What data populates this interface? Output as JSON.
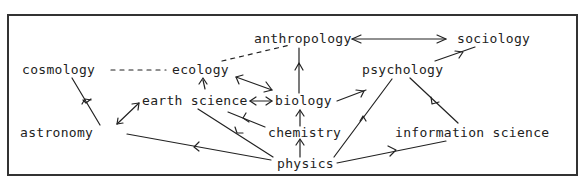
{
  "diagram": {
    "type": "concept-map",
    "stroke_color": "#222222",
    "frame_color": "#333333",
    "nodes": {
      "cosmology": "cosmology",
      "ecology": "ecology",
      "anthropology": "anthropology",
      "sociology": "sociology",
      "psychology": "psychology",
      "earth_science": "earth science",
      "biology": "biology",
      "astronomy": "astronomy",
      "chemistry": "chemistry",
      "information_science": "information science",
      "physics": "physics"
    },
    "edges": [
      {
        "from": "cosmology",
        "to": "ecology",
        "style": "dashed",
        "arrow": "none"
      },
      {
        "from": "ecology",
        "to": "anthropology",
        "style": "dashed",
        "arrow": "none"
      },
      {
        "from": "anthropology",
        "to": "sociology",
        "style": "solid",
        "arrow": "both"
      },
      {
        "from": "psychology",
        "to": "sociology",
        "style": "solid",
        "arrow": "to"
      },
      {
        "from": "biology",
        "to": "anthropology",
        "style": "solid",
        "arrow": "to"
      },
      {
        "from": "ecology",
        "to": "biology",
        "style": "solid",
        "arrow": "both"
      },
      {
        "from": "earth_science",
        "to": "ecology",
        "style": "solid",
        "arrow": "to"
      },
      {
        "from": "earth_science",
        "to": "biology",
        "style": "solid",
        "arrow": "both"
      },
      {
        "from": "biology",
        "to": "psychology",
        "style": "solid",
        "arrow": "to"
      },
      {
        "from": "astronomy",
        "to": "cosmology",
        "style": "solid",
        "arrow": "to"
      },
      {
        "from": "astronomy",
        "to": "earth_science",
        "style": "solid",
        "arrow": "both"
      },
      {
        "from": "chemistry",
        "to": "biology",
        "style": "solid",
        "arrow": "to"
      },
      {
        "from": "chemistry",
        "to": "earth_science",
        "style": "solid",
        "arrow": "to"
      },
      {
        "from": "physics",
        "to": "earth_science",
        "style": "solid",
        "arrow": "to"
      },
      {
        "from": "physics",
        "to": "astronomy",
        "style": "solid",
        "arrow": "to"
      },
      {
        "from": "physics",
        "to": "chemistry",
        "style": "solid",
        "arrow": "to"
      },
      {
        "from": "physics",
        "to": "psychology",
        "style": "solid",
        "arrow": "to"
      },
      {
        "from": "physics",
        "to": "information_science",
        "style": "solid",
        "arrow": "to"
      },
      {
        "from": "information_science",
        "to": "psychology",
        "style": "solid",
        "arrow": "to"
      }
    ]
  }
}
